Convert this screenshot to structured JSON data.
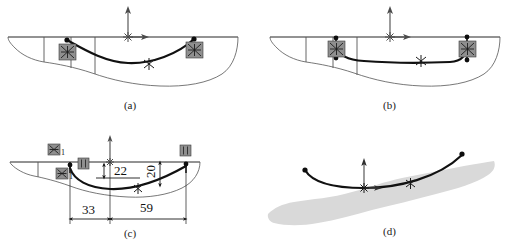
{
  "figure": {
    "panels": [
      {
        "id": "a",
        "caption": "(a)",
        "description": "Hull section outline with free-form spline between two fixture markers",
        "markers": [
          "fixture-icon",
          "fixture-icon"
        ],
        "origin_marker": "coordinate-system-origin",
        "endpoints": 2,
        "midpoint_markers": 1
      },
      {
        "id": "b",
        "caption": "(b)",
        "description": "Hull section with spline constrained by vertical tangent handles at both ends",
        "markers": [
          "fixture-icon",
          "fixture-icon"
        ],
        "origin_marker": "coordinate-system-origin",
        "endpoints": 2,
        "midpoint_markers": 1
      },
      {
        "id": "c",
        "caption": "(c)",
        "description": "Hull section with dimensional constraints applied to spline",
        "markers": [
          "fixture-icon-1",
          "dim-icon",
          "dim-icon",
          "fixture-icon"
        ],
        "origin_marker": "coordinate-system-origin",
        "endpoints": 2,
        "midpoint_markers": 1
      },
      {
        "id": "d",
        "caption": "(d)",
        "description": "Final spline curve over shaded hull plate region",
        "markers": [],
        "origin_marker": "coordinate-system-origin",
        "endpoints": 2,
        "midpoint_markers": 1
      }
    ],
    "dimensions": {
      "vertical_22": "22",
      "vertical_20": "20",
      "horizontal_33": "33",
      "horizontal_59": "59"
    },
    "marker_subscripts": {
      "fixture_1": "1",
      "fixture_1_lower": "1"
    },
    "colors": {
      "spline": "#111111",
      "hull_outline": "#555555",
      "marker_fill": "#8f8f8f",
      "blob_fill": "#d9d9d9",
      "dimension": "#1a1a1a",
      "background": "#ffffff"
    },
    "icon_names": {
      "fixture": "fixture-constraint-icon",
      "dimension": "dimension-constraint-icon",
      "origin": "coordinate-origin-icon",
      "node": "spline-node-icon",
      "tangent": "tangent-handle-icon"
    }
  }
}
